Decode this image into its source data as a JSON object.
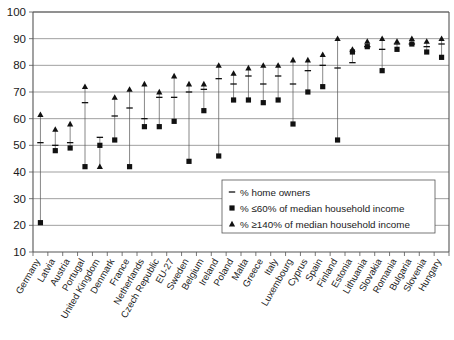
{
  "chart_data": {
    "type": "scatter",
    "title": "",
    "xlabel": "",
    "ylabel": "",
    "ylim": [
      10,
      100
    ],
    "ytick_step": 10,
    "grid": true,
    "legend_position": "inside-bottom-right",
    "yticks": [
      "100",
      "90",
      "80",
      "70",
      "60",
      "50",
      "40",
      "30",
      "20",
      "10"
    ],
    "categories": [
      "Germany",
      "Latvia",
      "Austria",
      "Portugal",
      "United Kingdom",
      "Denmark",
      "France",
      "Netherlands",
      "Czech Republic",
      "EU-27",
      "Sweden",
      "Belgium",
      "Ireland",
      "Poland",
      "Malta",
      "Greece",
      "Italy",
      "Luxembourg",
      "Cyprus",
      "Spain",
      "Finland",
      "Estonia",
      "Lithuania",
      "Slovakia",
      "Romania",
      "Bulgaria",
      "Slovenia",
      "Hungary"
    ],
    "series": [
      {
        "name": "% home owners",
        "marker": "dash",
        "values": [
          51,
          50,
          51,
          66,
          53,
          61,
          64,
          60,
          68,
          68,
          70,
          71,
          75,
          73,
          76,
          73,
          76,
          73,
          78,
          80,
          79,
          81,
          87,
          86,
          88,
          88,
          87,
          88
        ]
      },
      {
        "name": "% ≤60% of median household income",
        "marker": "square",
        "values": [
          21,
          48,
          49,
          42,
          50,
          52,
          42,
          57,
          57,
          59,
          44,
          63,
          46,
          67,
          67,
          66,
          67,
          58,
          70,
          72,
          52,
          85,
          87,
          78,
          86,
          88,
          85,
          83
        ]
      },
      {
        "name": "% ≥140% of median household income",
        "marker": "triangle",
        "values": [
          61.5,
          56,
          58,
          72,
          42,
          68,
          71,
          73,
          70,
          76,
          73,
          73,
          80,
          77,
          79,
          80,
          80,
          82,
          82,
          84,
          90,
          86,
          89,
          90,
          89,
          90,
          89,
          90
        ]
      }
    ],
    "legend": [
      {
        "marker": "dash",
        "label": "% home owners"
      },
      {
        "marker": "square",
        "label": "% ≤60% of median household income"
      },
      {
        "marker": "triangle",
        "label": "% ≥140% of median household income"
      }
    ],
    "colors": {
      "marker": "#111111",
      "grid": "#777777",
      "axis": "#555555",
      "background": "#ffffff"
    }
  }
}
